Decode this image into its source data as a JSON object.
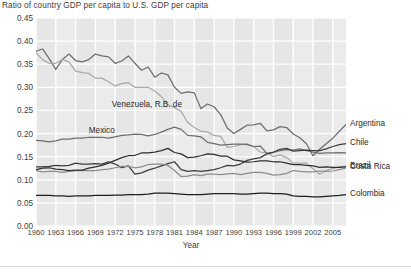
{
  "chart_data": {
    "type": "line",
    "title": "Ratio of country GDP per capita to U.S. GDP per capita",
    "xlabel": "Year",
    "ylabel": "",
    "xlim": [
      1960,
      2007
    ],
    "ylim": [
      0.0,
      0.45
    ],
    "grid": true,
    "legend_position": "inline-right",
    "yticks": [
      "0.00",
      "0.05",
      "0.10",
      "0.15",
      "0.20",
      "0.25",
      "0.30",
      "0.35",
      "0.40",
      "0.45"
    ],
    "ytick_values": [
      0.0,
      0.05,
      0.1,
      0.15,
      0.2,
      0.25,
      0.3,
      0.35,
      0.4,
      0.45
    ],
    "xticks": [
      "1960",
      "1963",
      "1966",
      "1969",
      "1972",
      "1975",
      "1978",
      "1981",
      "1984",
      "1987",
      "1990",
      "1993",
      "1996",
      "1999",
      "2002",
      "2005"
    ],
    "xtick_values": [
      1960,
      1963,
      1966,
      1969,
      1972,
      1975,
      1978,
      1981,
      1984,
      1987,
      1990,
      1993,
      1996,
      1999,
      2002,
      2005
    ],
    "x": [
      1960,
      1961,
      1962,
      1963,
      1964,
      1965,
      1966,
      1967,
      1968,
      1969,
      1970,
      1971,
      1972,
      1973,
      1974,
      1975,
      1976,
      1977,
      1978,
      1979,
      1980,
      1981,
      1982,
      1983,
      1984,
      1985,
      1986,
      1987,
      1988,
      1989,
      1990,
      1991,
      1992,
      1993,
      1994,
      1995,
      1996,
      1997,
      1998,
      1999,
      2000,
      2001,
      2002,
      2003,
      2004,
      2005,
      2006,
      2007
    ],
    "series": [
      {
        "name": "Argentina",
        "color": "#6e6e6e",
        "label_side": "right",
        "values": [
          0.378,
          0.383,
          0.362,
          0.339,
          0.36,
          0.372,
          0.358,
          0.355,
          0.36,
          0.372,
          0.368,
          0.366,
          0.352,
          0.357,
          0.368,
          0.352,
          0.337,
          0.344,
          0.322,
          0.331,
          0.327,
          0.3,
          0.287,
          0.29,
          0.288,
          0.254,
          0.264,
          0.258,
          0.241,
          0.212,
          0.2,
          0.209,
          0.218,
          0.219,
          0.222,
          0.206,
          0.208,
          0.215,
          0.213,
          0.199,
          0.191,
          0.178,
          0.152,
          0.166,
          0.178,
          0.19,
          0.205,
          0.22
        ]
      },
      {
        "name": "Venezuela, R.B. de",
        "color": "#a9a9a9",
        "label_side": "inline",
        "values": [
          0.375,
          0.36,
          0.352,
          0.352,
          0.36,
          0.355,
          0.335,
          0.332,
          0.33,
          0.32,
          0.32,
          0.312,
          0.303,
          0.308,
          0.31,
          0.3,
          0.3,
          0.3,
          0.292,
          0.28,
          0.263,
          0.256,
          0.248,
          0.224,
          0.213,
          0.205,
          0.203,
          0.196,
          0.194,
          0.17,
          0.172,
          0.176,
          0.178,
          0.172,
          0.16,
          0.158,
          0.15,
          0.154,
          0.148,
          0.136,
          0.136,
          0.136,
          0.124,
          0.112,
          0.12,
          0.124,
          0.128,
          0.13
        ]
      },
      {
        "name": "Mexico",
        "color": "#6e6e6e",
        "label_side": "inline",
        "values": [
          0.185,
          0.184,
          0.182,
          0.184,
          0.188,
          0.188,
          0.19,
          0.19,
          0.192,
          0.192,
          0.192,
          0.19,
          0.193,
          0.196,
          0.197,
          0.199,
          0.198,
          0.195,
          0.198,
          0.203,
          0.209,
          0.214,
          0.209,
          0.196,
          0.195,
          0.193,
          0.181,
          0.178,
          0.175,
          0.176,
          0.177,
          0.177,
          0.176,
          0.172,
          0.173,
          0.157,
          0.159,
          0.163,
          0.165,
          0.164,
          0.167,
          0.163,
          0.16,
          0.157,
          0.158,
          0.158,
          0.159,
          0.158
        ]
      },
      {
        "name": "Chile",
        "color": "#3c3c3c",
        "label_side": "right",
        "values": [
          0.128,
          0.128,
          0.129,
          0.131,
          0.13,
          0.131,
          0.136,
          0.134,
          0.134,
          0.135,
          0.134,
          0.139,
          0.134,
          0.126,
          0.13,
          0.112,
          0.115,
          0.121,
          0.125,
          0.13,
          0.135,
          0.139,
          0.122,
          0.118,
          0.12,
          0.118,
          0.12,
          0.122,
          0.126,
          0.131,
          0.13,
          0.134,
          0.142,
          0.145,
          0.148,
          0.156,
          0.16,
          0.166,
          0.168,
          0.162,
          0.163,
          0.164,
          0.163,
          0.163,
          0.167,
          0.172,
          0.176,
          0.178
        ]
      },
      {
        "name": "Costa Rica",
        "color": "#8c8c8c",
        "label_side": "right",
        "values": [
          0.12,
          0.117,
          0.118,
          0.118,
          0.116,
          0.118,
          0.12,
          0.12,
          0.12,
          0.12,
          0.122,
          0.123,
          0.126,
          0.129,
          0.129,
          0.126,
          0.128,
          0.133,
          0.134,
          0.134,
          0.131,
          0.12,
          0.107,
          0.108,
          0.111,
          0.109,
          0.112,
          0.112,
          0.111,
          0.113,
          0.114,
          0.111,
          0.114,
          0.116,
          0.116,
          0.114,
          0.11,
          0.111,
          0.114,
          0.12,
          0.118,
          0.117,
          0.117,
          0.119,
          0.118,
          0.119,
          0.122,
          0.126
        ]
      },
      {
        "name": "Brazil",
        "color": "#2e2e2e",
        "label_side": "right",
        "values": [
          0.122,
          0.125,
          0.126,
          0.123,
          0.122,
          0.12,
          0.121,
          0.121,
          0.125,
          0.128,
          0.131,
          0.136,
          0.142,
          0.148,
          0.152,
          0.153,
          0.158,
          0.158,
          0.16,
          0.163,
          0.168,
          0.159,
          0.156,
          0.148,
          0.149,
          0.152,
          0.156,
          0.155,
          0.151,
          0.151,
          0.143,
          0.141,
          0.138,
          0.139,
          0.141,
          0.141,
          0.139,
          0.139,
          0.136,
          0.133,
          0.133,
          0.131,
          0.13,
          0.127,
          0.128,
          0.127,
          0.127,
          0.128
        ]
      },
      {
        "name": "Colombia",
        "color": "#1e1e1e",
        "label_side": "right",
        "values": [
          0.066,
          0.066,
          0.066,
          0.065,
          0.065,
          0.064,
          0.065,
          0.065,
          0.065,
          0.066,
          0.066,
          0.066,
          0.067,
          0.067,
          0.068,
          0.068,
          0.068,
          0.069,
          0.071,
          0.071,
          0.071,
          0.07,
          0.069,
          0.068,
          0.068,
          0.068,
          0.069,
          0.07,
          0.07,
          0.07,
          0.07,
          0.069,
          0.069,
          0.07,
          0.071,
          0.071,
          0.07,
          0.07,
          0.069,
          0.065,
          0.064,
          0.064,
          0.063,
          0.063,
          0.064,
          0.065,
          0.066,
          0.068
        ]
      }
    ],
    "annotations": [
      {
        "text": "Venezuela, R.B. de",
        "x": 1971.5,
        "y": 0.262
      },
      {
        "text": "Mexico",
        "x": 1968.0,
        "y": 0.205
      }
    ]
  }
}
